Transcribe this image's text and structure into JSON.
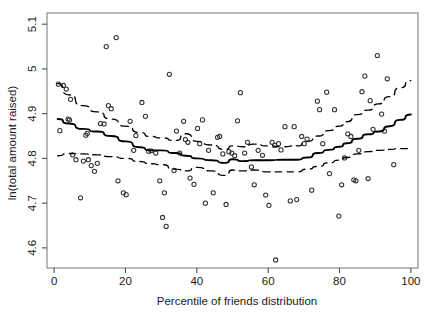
{
  "chart_data": {
    "type": "scatter",
    "title": "",
    "subtitle": "",
    "xlabel": "Percentile of friends distribution",
    "ylabel": "ln(total amount raised)",
    "xlim": [
      -2,
      102
    ],
    "ylim": [
      4.555,
      5.125
    ],
    "xticks": [
      0,
      20,
      40,
      60,
      80,
      100
    ],
    "xtick_labels": [
      "0",
      "20",
      "40",
      "60",
      "80",
      "100"
    ],
    "yticks": [
      4.6,
      4.7,
      4.8,
      4.9,
      5.0,
      5.1
    ],
    "ytick_labels": [
      "4.6",
      "4.7",
      "4.8",
      "4.9",
      "5",
      "5.1"
    ],
    "grid": false,
    "legend": null,
    "legend_position": "none",
    "marker": "open-square-circle",
    "marker_color": "#333333",
    "line_color": "#000000",
    "box_color": "#808080",
    "points": [
      [
        1.2,
        4.966
      ],
      [
        1.6,
        4.862
      ],
      [
        2.6,
        4.963
      ],
      [
        3.4,
        4.955
      ],
      [
        3.9,
        4.888
      ],
      [
        4.3,
        4.886
      ],
      [
        4.6,
        4.932
      ],
      [
        5.2,
        4.808
      ],
      [
        6.1,
        4.797
      ],
      [
        7.4,
        4.712
      ],
      [
        8.2,
        4.794
      ],
      [
        8.9,
        4.852
      ],
      [
        9.3,
        4.856
      ],
      [
        9.6,
        4.797
      ],
      [
        10.4,
        4.784
      ],
      [
        11.3,
        4.771
      ],
      [
        12.1,
        4.789
      ],
      [
        13.0,
        4.878
      ],
      [
        14.0,
        4.877
      ],
      [
        14.6,
        5.05
      ],
      [
        15.2,
        4.918
      ],
      [
        16.0,
        4.911
      ],
      [
        17.4,
        5.07
      ],
      [
        17.9,
        4.75
      ],
      [
        19.4,
        4.723
      ],
      [
        20.2,
        4.719
      ],
      [
        21.3,
        4.883
      ],
      [
        22.3,
        4.818
      ],
      [
        22.9,
        4.851
      ],
      [
        24.6,
        4.925
      ],
      [
        25.6,
        4.894
      ],
      [
        26.5,
        4.816
      ],
      [
        27.2,
        4.817
      ],
      [
        28.5,
        4.812
      ],
      [
        29.6,
        4.75
      ],
      [
        30.4,
        4.668
      ],
      [
        30.9,
        4.723
      ],
      [
        31.4,
        4.648
      ],
      [
        32.3,
        4.988
      ],
      [
        33.6,
        4.773
      ],
      [
        34.3,
        4.861
      ],
      [
        35.2,
        4.812
      ],
      [
        36.3,
        4.883
      ],
      [
        36.8,
        4.842
      ],
      [
        37.5,
        4.836
      ],
      [
        38.1,
        4.756
      ],
      [
        39.2,
        4.742
      ],
      [
        40.2,
        4.867
      ],
      [
        40.8,
        4.833
      ],
      [
        41.6,
        4.886
      ],
      [
        42.4,
        4.7
      ],
      [
        43.3,
        4.818
      ],
      [
        44.6,
        4.723
      ],
      [
        45.8,
        4.847
      ],
      [
        46.4,
        4.849
      ],
      [
        47.3,
        4.81
      ],
      [
        48.2,
        4.697
      ],
      [
        49.0,
        4.815
      ],
      [
        49.8,
        4.812
      ],
      [
        50.6,
        4.806
      ],
      [
        51.4,
        4.884
      ],
      [
        52.2,
        4.947
      ],
      [
        53.4,
        4.812
      ],
      [
        54.2,
        4.836
      ],
      [
        55.3,
        4.781
      ],
      [
        56.1,
        4.741
      ],
      [
        57.2,
        4.818
      ],
      [
        58.4,
        4.807
      ],
      [
        59.3,
        4.718
      ],
      [
        60.2,
        4.695
      ],
      [
        61.1,
        4.836
      ],
      [
        61.8,
        4.829
      ],
      [
        62.1,
        4.573
      ],
      [
        62.9,
        4.833
      ],
      [
        63.6,
        4.819
      ],
      [
        64.7,
        4.871
      ],
      [
        66.2,
        4.705
      ],
      [
        67.3,
        4.871
      ],
      [
        68.0,
        4.708
      ],
      [
        69.4,
        4.849
      ],
      [
        70.1,
        4.833
      ],
      [
        70.9,
        4.843
      ],
      [
        72.2,
        4.729
      ],
      [
        73.8,
        4.928
      ],
      [
        74.4,
        4.909
      ],
      [
        75.3,
        4.833
      ],
      [
        76.4,
        4.948
      ],
      [
        77.2,
        4.766
      ],
      [
        78.6,
        4.909
      ],
      [
        79.8,
        4.671
      ],
      [
        80.6,
        4.741
      ],
      [
        81.4,
        4.801
      ],
      [
        82.3,
        4.855
      ],
      [
        83.2,
        4.849
      ],
      [
        84.0,
        4.752
      ],
      [
        84.6,
        4.75
      ],
      [
        85.4,
        4.818
      ],
      [
        86.3,
        4.949
      ],
      [
        87.1,
        4.984
      ],
      [
        88.0,
        4.755
      ],
      [
        88.6,
        4.929
      ],
      [
        89.4,
        4.865
      ],
      [
        90.6,
        5.03
      ],
      [
        91.8,
        4.899
      ],
      [
        92.6,
        4.861
      ],
      [
        93.4,
        4.978
      ],
      [
        95.2,
        4.786
      ]
    ],
    "series": [
      {
        "name": "fitted",
        "style": "solid",
        "x": [
          1,
          4,
          8,
          12,
          16,
          20,
          24,
          27,
          30,
          34,
          37,
          40,
          44,
          48,
          50,
          53,
          56,
          60,
          64,
          68,
          71,
          74,
          77,
          80,
          82,
          85,
          88,
          91,
          94,
          97,
          100
        ],
        "y": [
          4.888,
          4.878,
          4.866,
          4.86,
          4.85,
          4.838,
          4.825,
          4.818,
          4.818,
          4.812,
          4.806,
          4.8,
          4.796,
          4.79,
          4.798,
          4.794,
          4.796,
          4.796,
          4.797,
          4.797,
          4.802,
          4.812,
          4.819,
          4.826,
          4.834,
          4.844,
          4.854,
          4.86,
          4.872,
          4.886,
          4.898
        ]
      },
      {
        "name": "upper-confidence-band",
        "style": "dashed",
        "x": [
          1,
          4,
          8,
          12,
          16,
          20,
          24,
          27,
          30,
          34,
          37,
          40,
          44,
          48,
          50,
          53,
          56,
          60,
          64,
          68,
          71,
          74,
          77,
          80,
          82,
          85,
          88,
          91,
          94,
          97,
          100
        ],
        "y": [
          4.967,
          4.942,
          4.918,
          4.904,
          4.888,
          4.872,
          4.858,
          4.849,
          4.846,
          4.84,
          4.855,
          4.838,
          4.83,
          4.82,
          4.828,
          4.826,
          4.832,
          4.828,
          4.826,
          4.828,
          4.838,
          4.85,
          4.862,
          4.872,
          4.882,
          4.898,
          4.908,
          4.922,
          4.938,
          4.958,
          4.974
        ]
      },
      {
        "name": "lower-confidence-band",
        "style": "dashed",
        "x": [
          1,
          4,
          8,
          12,
          16,
          20,
          24,
          27,
          30,
          34,
          37,
          40,
          44,
          48,
          50,
          53,
          56,
          60,
          64,
          68,
          71,
          74,
          77,
          80,
          82,
          85,
          88,
          91,
          94,
          97,
          100
        ],
        "y": [
          4.806,
          4.811,
          4.81,
          4.808,
          4.804,
          4.8,
          4.793,
          4.788,
          4.786,
          4.776,
          4.772,
          4.78,
          4.772,
          4.762,
          4.774,
          4.772,
          4.774,
          4.77,
          4.77,
          4.77,
          4.776,
          4.782,
          4.79,
          4.796,
          4.802,
          4.81,
          4.815,
          4.818,
          4.82,
          4.822,
          4.822
        ]
      }
    ]
  }
}
